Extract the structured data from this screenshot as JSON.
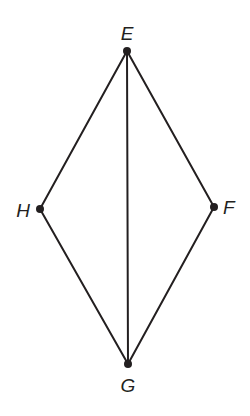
{
  "diagram": {
    "type": "quadrilateral-with-diagonal",
    "stroke_color": "#231f20",
    "background": "#ffffff",
    "points": {
      "E": {
        "label": "E",
        "x": 127,
        "y": 51
      },
      "F": {
        "label": "F",
        "x": 214,
        "y": 207
      },
      "G": {
        "label": "G",
        "x": 128,
        "y": 364
      },
      "H": {
        "label": "H",
        "x": 40,
        "y": 209
      }
    },
    "segments": [
      {
        "from": "E",
        "to": "F"
      },
      {
        "from": "F",
        "to": "G"
      },
      {
        "from": "G",
        "to": "H"
      },
      {
        "from": "H",
        "to": "E"
      },
      {
        "from": "E",
        "to": "G"
      }
    ],
    "labels": {
      "E": "E",
      "F": "F",
      "G": "G",
      "H": "H"
    }
  }
}
